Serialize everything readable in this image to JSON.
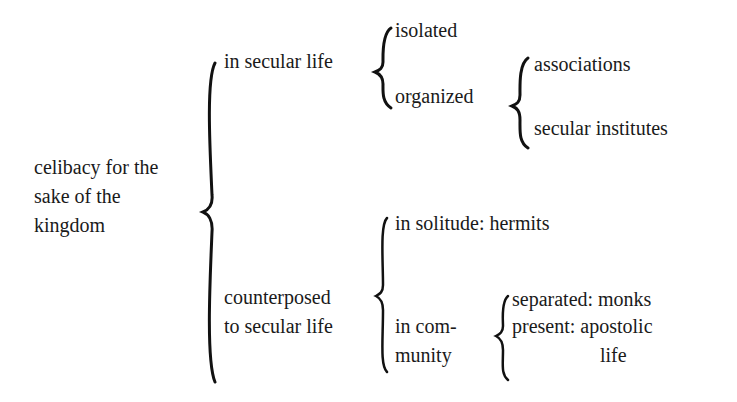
{
  "diagram": {
    "root": {
      "lines": [
        "celibacy for the",
        "sake of the",
        "kingdom"
      ]
    },
    "level1": [
      {
        "label": "in secular life"
      },
      {
        "lines": [
          "counterposed",
          "to secular life"
        ]
      }
    ],
    "secular_life_branches": [
      {
        "label": "isolated"
      },
      {
        "label": "organized"
      }
    ],
    "organized_branches": [
      {
        "label": "associations"
      },
      {
        "label": "secular institutes"
      }
    ],
    "counterposed_branches": [
      {
        "label": "in solitude: hermits"
      },
      {
        "lines": [
          "in com-",
          "munity"
        ]
      }
    ],
    "community_branches": [
      {
        "label": "separated: monks"
      },
      {
        "lines": [
          "present: apostolic",
          "life"
        ]
      }
    ]
  }
}
